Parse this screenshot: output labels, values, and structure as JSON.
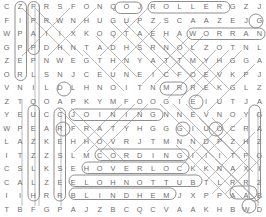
{
  "puzzle": {
    "title": "word-search-grid",
    "rows": 16,
    "cols": 20,
    "letter_color": "#6d6d6d",
    "mark_color": "#9a9a9a",
    "background": "#ffffff",
    "grid": [
      [
        "C",
        "Z",
        "F",
        "R",
        "S",
        "F",
        "O",
        "N",
        "Q",
        "O",
        "J",
        "R",
        "O",
        "L",
        "L",
        "E",
        "R",
        "G",
        "Z",
        "J"
      ],
      [
        "F",
        "I",
        "P",
        "R",
        "W",
        "N",
        "H",
        "U",
        "G",
        "U",
        "P",
        "Z",
        "S",
        "C",
        "A",
        "A",
        "Z",
        "E",
        "J",
        "G"
      ],
      [
        "W",
        "P",
        "A",
        "I",
        "I",
        "X",
        "K",
        "O",
        "Q",
        "T",
        "A",
        "E",
        "H",
        "A",
        "W",
        "O",
        "R",
        "R",
        "A",
        "N"
      ],
      [
        "G",
        "P",
        "P",
        "D",
        "H",
        "N",
        "T",
        "A",
        "D",
        "H",
        "S",
        "R",
        "N",
        "O",
        "L",
        "Z",
        "O",
        "T",
        "N",
        "L"
      ],
      [
        "Z",
        "E",
        "P",
        "N",
        "W",
        "E",
        "G",
        "T",
        "H",
        "N",
        "Y",
        "A",
        "T",
        "T",
        "M",
        "Y",
        "H",
        "G",
        "G",
        "A"
      ],
      [
        "O",
        "R",
        "L",
        "S",
        "N",
        "J",
        "C",
        "E",
        "U",
        "N",
        "E",
        "I",
        "C",
        "F",
        "O",
        "E",
        "V",
        "K",
        "P",
        "J"
      ],
      [
        "V",
        "N",
        "I",
        "L",
        "D",
        "L",
        "H",
        "N",
        "O",
        "I",
        "T",
        "N",
        "M",
        "R",
        "R",
        "E",
        "K",
        "G",
        "L",
        "Z"
      ],
      [
        "Z",
        "T",
        "Q",
        "O",
        "A",
        "P",
        "K",
        "Y",
        "M",
        "F",
        "O",
        "O",
        "G",
        "I",
        "E",
        "I",
        "U",
        "T",
        "J",
        "A"
      ],
      [
        "Y",
        "E",
        "U",
        "C",
        "C",
        "J",
        "O",
        "I",
        "N",
        "I",
        "N",
        "G",
        "N",
        "N",
        "E",
        "V",
        "N",
        "O",
        "Y",
        "G"
      ],
      [
        "W",
        "P",
        "E",
        "A",
        "R",
        "F",
        "R",
        "A",
        "T",
        "Y",
        "H",
        "G",
        "G",
        "G",
        "I",
        "U",
        "O",
        "C",
        "R",
        "A"
      ],
      [
        "L",
        "A",
        "Z",
        "K",
        "E",
        "H",
        "H",
        "O",
        "V",
        "R",
        "J",
        "T",
        "M",
        "N",
        "N",
        "D",
        "P",
        "Z",
        "H",
        "Z"
      ],
      [
        "I",
        "T",
        "Z",
        "Z",
        "S",
        "L",
        "M",
        "C",
        "O",
        "R",
        "D",
        "I",
        "N",
        "G",
        "I",
        "I",
        "I",
        "T",
        "P",
        "G"
      ],
      [
        "C",
        "S",
        "L",
        "K",
        "S",
        "E",
        "H",
        "O",
        "V",
        "E",
        "R",
        "L",
        "O",
        "C",
        "K",
        "K",
        "N",
        "A",
        "X",
        "I"
      ],
      [
        "C",
        "A",
        "L",
        "Z",
        "E",
        "E",
        "L",
        "O",
        "H",
        "N",
        "O",
        "T",
        "T",
        "U",
        "B",
        "T",
        "L",
        "R",
        "R",
        "Z"
      ],
      [
        "I",
        "I",
        "H",
        "R",
        "R",
        "B",
        "L",
        "I",
        "N",
        "D",
        "H",
        "E",
        "M",
        "J",
        "X",
        "P",
        "P",
        "A",
        "A",
        "B"
      ],
      [
        "T",
        "B",
        "F",
        "G",
        "P",
        "A",
        "J",
        "Z",
        "B",
        "C",
        "Q",
        "C",
        "V",
        "A",
        "A",
        "K",
        "H",
        "B",
        "W",
        "D"
      ]
    ],
    "found_words": [
      {
        "word": "ROLLER",
        "row": 0,
        "col_start": 11,
        "col_end": 16,
        "direction": "horizontal"
      },
      {
        "word": "NARROW",
        "row": 2,
        "col_start": 14,
        "col_end": 19,
        "direction": "horizontal-reversed"
      },
      {
        "word": "JOINING",
        "row": 8,
        "col_start": 5,
        "col_end": 11,
        "direction": "horizontal"
      },
      {
        "word": "CORDING",
        "row": 11,
        "col_start": 7,
        "col_end": 13,
        "direction": "horizontal"
      },
      {
        "word": "OVERLOCK",
        "row": 12,
        "col_start": 6,
        "col_end": 13,
        "direction": "horizontal"
      },
      {
        "word": "BUTTONHOLE",
        "row": 13,
        "col_start": 5,
        "col_end": 14,
        "direction": "horizontal-reversed"
      },
      {
        "word": "BLINDHEM",
        "row": 14,
        "col_start": 5,
        "col_end": 12,
        "direction": "horizontal"
      }
    ]
  }
}
